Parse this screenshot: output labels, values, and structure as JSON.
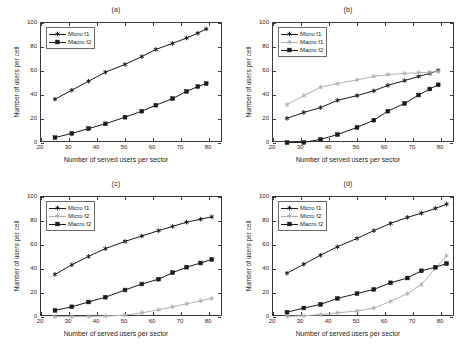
{
  "figure": {
    "xlabel": "Number of served users per sector",
    "ylabel": "Number of users per cell",
    "xticks": [
      20,
      30,
      40,
      50,
      60,
      70,
      80
    ],
    "yticks": [
      0,
      20,
      40,
      60,
      80,
      100
    ],
    "xlim": [
      20,
      85
    ],
    "ylim": [
      0,
      100
    ],
    "colors": {
      "dark": "#1a1a1a",
      "gray": "#b0b0b0",
      "axis": "#3a3a3a"
    }
  },
  "chart_data": [
    {
      "type": "line",
      "title": "(a)",
      "xlabel": "Number of served users per sector",
      "ylabel": "Number of users per cell",
      "xlim": [
        20,
        85
      ],
      "ylim": [
        0,
        100
      ],
      "xticks": [
        20,
        30,
        40,
        50,
        60,
        70,
        80
      ],
      "yticks": [
        0,
        20,
        40,
        60,
        80,
        100
      ],
      "grid": false,
      "legend_position": "upper-left",
      "x": [
        25,
        31,
        37,
        43,
        50,
        56,
        61,
        67,
        72,
        76,
        79
      ],
      "series": [
        {
          "name": "Micro f1",
          "color": "#1a1a1a",
          "marker": "star",
          "values": [
            36.5,
            44.0,
            51.5,
            59.0,
            65.5,
            72.0,
            78.0,
            83.0,
            87.5,
            91.5,
            95.0
          ]
        },
        {
          "name": "Macro f2",
          "color": "#1a1a1a",
          "marker": "square",
          "values": [
            4.5,
            8.0,
            12.0,
            16.0,
            21.5,
            26.5,
            31.5,
            37.0,
            43.0,
            47.0,
            49.5
          ]
        }
      ]
    },
    {
      "type": "line",
      "title": "(b)",
      "xlabel": "Number of served users per sector",
      "ylabel": "Number of users per cell",
      "xlim": [
        20,
        85
      ],
      "ylim": [
        0,
        100
      ],
      "xticks": [
        20,
        30,
        40,
        50,
        60,
        70,
        80
      ],
      "yticks": [
        0,
        20,
        40,
        60,
        80,
        100
      ],
      "grid": false,
      "legend_position": "upper-left",
      "x": [
        25,
        31,
        37,
        43,
        50,
        56,
        61,
        67,
        72,
        76,
        79
      ],
      "series": [
        {
          "name": "Micro f1",
          "color": "#1a1a1a",
          "marker": "star",
          "values": [
            20.5,
            25.5,
            29.5,
            35.5,
            39.5,
            43.5,
            48.0,
            52.0,
            55.5,
            58.0,
            60.5
          ]
        },
        {
          "name": "Macro f1",
          "color": "#b0b0b0",
          "marker": "star",
          "values": [
            32.0,
            39.5,
            46.5,
            49.5,
            52.5,
            55.5,
            57.0,
            58.0,
            58.5,
            59.0,
            59.5
          ]
        },
        {
          "name": "Macro f2",
          "color": "#1a1a1a",
          "marker": "square",
          "values": [
            0.3,
            0.5,
            3.0,
            7.0,
            13.0,
            19.0,
            26.5,
            33.0,
            40.0,
            45.0,
            48.5
          ]
        }
      ]
    },
    {
      "type": "line",
      "title": "(c)",
      "xlabel": "Number of served users per sector",
      "ylabel": "Number of users per cell",
      "xlim": [
        20,
        85
      ],
      "ylim": [
        0,
        100
      ],
      "xticks": [
        20,
        30,
        40,
        50,
        60,
        70,
        80
      ],
      "yticks": [
        0,
        20,
        40,
        60,
        80,
        100
      ],
      "grid": false,
      "legend_position": "upper-left",
      "x": [
        25,
        31,
        37,
        43,
        50,
        56,
        62,
        67,
        72,
        77,
        81
      ],
      "series": [
        {
          "name": "Micro f1",
          "color": "#1a1a1a",
          "marker": "star",
          "values": [
            35.5,
            43.5,
            50.5,
            57.0,
            63.0,
            67.5,
            72.0,
            75.5,
            79.0,
            81.5,
            83.5
          ]
        },
        {
          "name": "Micro f2",
          "color": "#b0b0b0",
          "marker": "star",
          "values": [
            0.2,
            0.3,
            0.5,
            0.8,
            1.5,
            3.5,
            6.0,
            8.5,
            11.0,
            13.5,
            15.5
          ]
        },
        {
          "name": "Macro f2",
          "color": "#1a1a1a",
          "marker": "square",
          "values": [
            5.5,
            8.5,
            12.5,
            16.5,
            22.5,
            27.5,
            31.5,
            37.0,
            41.5,
            45.0,
            48.0
          ]
        }
      ]
    },
    {
      "type": "line",
      "title": "(d)",
      "xlabel": "Number of served users per sector",
      "ylabel": "Number of users per cell",
      "xlim": [
        20,
        85
      ],
      "ylim": [
        0,
        100
      ],
      "xticks": [
        20,
        30,
        40,
        50,
        60,
        70,
        80
      ],
      "yticks": [
        0,
        20,
        40,
        60,
        80,
        100
      ],
      "grid": false,
      "legend_position": "upper-left",
      "x": [
        25,
        31,
        37,
        43,
        50,
        56,
        62,
        68,
        73,
        78,
        82
      ],
      "series": [
        {
          "name": "Micro f1",
          "color": "#1a1a1a",
          "marker": "star",
          "values": [
            36.5,
            44.0,
            51.5,
            58.5,
            65.5,
            72.0,
            78.0,
            83.0,
            86.5,
            90.5,
            94.0
          ]
        },
        {
          "name": "Micro f2",
          "color": "#b0b0b0",
          "marker": "star",
          "values": [
            0.5,
            1.0,
            2.0,
            3.5,
            5.0,
            7.5,
            13.0,
            19.5,
            27.0,
            40.5,
            51.0
          ]
        },
        {
          "name": "Macro f2",
          "color": "#1a1a1a",
          "marker": "square",
          "values": [
            4.0,
            7.5,
            10.5,
            15.5,
            19.5,
            23.0,
            28.5,
            32.5,
            38.5,
            41.5,
            44.5
          ]
        }
      ]
    }
  ]
}
